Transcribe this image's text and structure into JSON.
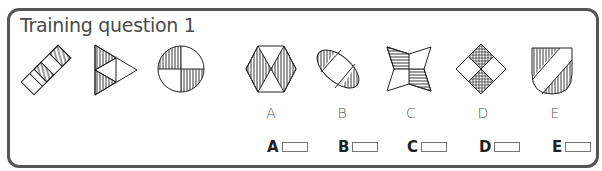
{
  "question": {
    "title": "Training question 1",
    "sequence_shapes": [
      {
        "id": "q1",
        "icon": "rotated-rectangle-diagonal-stripes-icon"
      },
      {
        "id": "q2",
        "icon": "triangle-vertical-stripes-icon"
      },
      {
        "id": "q3",
        "icon": "circle-quarters-vertical-stripes-icon"
      }
    ]
  },
  "options": [
    {
      "letter": "A",
      "icon": "hexagon-hourglass-stripes-icon"
    },
    {
      "letter": "B",
      "icon": "ellipse-diagonal-stripes-icon"
    },
    {
      "letter": "C",
      "icon": "star-bowtie-horizontal-stripes-icon"
    },
    {
      "letter": "D",
      "icon": "diamond-crosshatch-icon"
    },
    {
      "letter": "E",
      "icon": "shield-diagonal-stripes-icon"
    }
  ],
  "answers": [
    {
      "label": "A"
    },
    {
      "label": "B"
    },
    {
      "label": "C"
    },
    {
      "label": "D"
    },
    {
      "label": "E"
    }
  ],
  "colors": {
    "frame": "#555555",
    "stroke": "#222222"
  }
}
